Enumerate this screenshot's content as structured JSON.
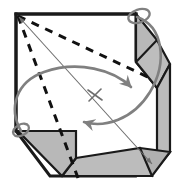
{
  "figure": {
    "title": "Folded square sheet with corner flaps and rotation arrows",
    "type": "origami-fold-diagram",
    "canvas": {
      "width": 183,
      "height": 190
    },
    "colors": {
      "background": "#ffffff",
      "outline": "#1a1a1a",
      "flap_fill": "#b8b8b8",
      "flap_fill_dark": "#a8a8a8",
      "arrow": "#808080",
      "axis_line": "#6e6e6e",
      "fold_dash": "#111111"
    },
    "stroke_widths": {
      "outline": 3.0,
      "flap_edge": 2.2,
      "arrow": 2.6,
      "axis": 1.1,
      "dash": 3.0
    }
  },
  "sheet": {
    "label": "square-sheet",
    "outline_points": "16,14 136,14 136,60 160,60 160,154 136,176 50,176 16,131",
    "top_edge": {
      "x1": 16,
      "y1": 14,
      "x2": 136,
      "y2": 14
    },
    "left_edge": {
      "x1": 16,
      "y1": 14,
      "x2": 16,
      "y2": 131
    }
  },
  "flaps": [
    {
      "name": "top-right-flap",
      "description": "Gray parallelogram band folded down along the right of the top edge",
      "points": "136,14 157,40 157,88 136,62",
      "fill": "#b8b8b8"
    },
    {
      "name": "top-right-flap-tip",
      "description": "Small triangular gusset below the top-right flap",
      "points": "136,62 157,88 170,64 157,40",
      "fill": "#bdbdbd"
    },
    {
      "name": "right-side-band",
      "description": "Vertical gray band along the right edge",
      "points": "157,88 170,64 170,152 157,168",
      "fill": "#bcbcbc"
    },
    {
      "name": "bottom-right-corner-gusset",
      "description": "Chamfered gray corner where bottom and right bands meet",
      "points": "140,148 170,152 152,176 132,170",
      "fill": "#b0b0b0"
    },
    {
      "name": "bottom-band",
      "description": "Horizontal gray band along the bottom edge",
      "points": "76,158 140,148 152,176 62,176",
      "fill": "#bcbcbc"
    },
    {
      "name": "bottom-left-flap",
      "description": "Gray quadrilateral flap folded up at the bottom-left corner",
      "points": "18,131 76,131 76,158 62,176",
      "fill": "#b8b8b8"
    }
  ],
  "fold_lines": [
    {
      "name": "fold-diagonal-to-right",
      "style": "dashed",
      "from": {
        "x": 18,
        "y": 16
      },
      "to": {
        "x": 150,
        "y": 78
      }
    },
    {
      "name": "fold-diagonal-to-bottom",
      "style": "dashed",
      "from": {
        "x": 18,
        "y": 16
      },
      "to": {
        "x": 78,
        "y": 178
      }
    }
  ],
  "axis": {
    "name": "main-diagonal-axis",
    "style": "thin double-headed arrow",
    "from": {
      "x": 19,
      "y": 17
    },
    "to": {
      "x": 152,
      "y": 164
    },
    "double_headed": true
  },
  "rotation_arrows": [
    {
      "name": "top-right-rotation-arrow",
      "description": "Gray curved arrow looping about the top-right corner pivot",
      "pivot": {
        "x": 137,
        "y": 17
      },
      "direction": "clockwise-down-left",
      "arrowhead_at": {
        "x": 94,
        "y": 108
      }
    },
    {
      "name": "bottom-left-rotation-arrow",
      "description": "Gray curved arrow looping about the bottom-left corner pivot",
      "pivot": {
        "x": 22,
        "y": 131
      },
      "direction": "counter-clockwise-up-right",
      "arrowhead_at": {
        "x": 120,
        "y": 84
      }
    }
  ],
  "markers": [
    {
      "name": "center-crossing-mark",
      "description": "Small X where the rotation arcs cross the diagonal axis",
      "x": 95,
      "y": 95
    },
    {
      "name": "top-right-pivot-loop",
      "description": "Small gray ellipse loop marking the top-right pivot",
      "x": 137,
      "y": 16
    },
    {
      "name": "bottom-left-pivot-loop",
      "description": "Small gray ellipse loop marking the bottom-left pivot",
      "x": 21,
      "y": 131
    }
  ]
}
